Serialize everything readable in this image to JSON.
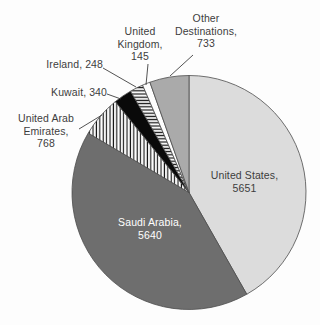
{
  "chart_data": {
    "type": "pie",
    "total": 13525,
    "start_angle_deg": 0,
    "direction": "clockwise",
    "legend": "none",
    "label_style": "name-comma-value; large slices labeled inside, small slices labeled outside with leader lines",
    "slices": [
      {
        "name": "United States",
        "value": 5651,
        "label": "United States,\n5651",
        "fill": "#dcdcdc",
        "pattern": "none",
        "label_placement": "inside"
      },
      {
        "name": "Saudi Arabia",
        "value": 5640,
        "label": "Saudi Arabia,\n5640",
        "fill": "#6e6e6e",
        "pattern": "none",
        "label_placement": "inside"
      },
      {
        "name": "United Arab Emirates",
        "value": 768,
        "label": "United Arab\nEmirates,\n768",
        "fill": "#ffffff",
        "pattern": "vertical-stripes",
        "label_placement": "outside"
      },
      {
        "name": "Kuwait",
        "value": 340,
        "label": "Kuwait, 340",
        "fill": "#0a0a0a",
        "pattern": "none",
        "label_placement": "outside"
      },
      {
        "name": "Ireland",
        "value": 248,
        "label": "Ireland, 248",
        "fill": "#ffffff",
        "pattern": "horizontal-stripes",
        "label_placement": "outside"
      },
      {
        "name": "United Kingdom",
        "value": 145,
        "label": "United\nKingdom,\n145",
        "fill": "#fefefe",
        "pattern": "none",
        "label_placement": "outside"
      },
      {
        "name": "Other Destinations",
        "value": 733,
        "label": "Other\nDestinations,\n733",
        "fill": "#aaaaaa",
        "pattern": "none",
        "label_placement": "outside"
      }
    ],
    "colors": {
      "slice_outline": "#4d4d4d",
      "leader_line": "#3f3f3f",
      "label_text": "#3d3d3d",
      "inside_label_on_dark": "#ffffff"
    }
  }
}
